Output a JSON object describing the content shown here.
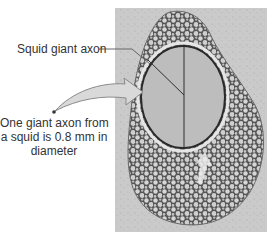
{
  "figure": {
    "label_axon": "Squid giant axon",
    "caption_lines": [
      "One giant axon from",
      "a squid is 0.8 mm in",
      "diameter"
    ],
    "colors": {
      "panel_background": "#c9c9c9",
      "tissue_dark": "#5a5a5a",
      "tissue_cell": "#d8d8d8",
      "axon_fill": "#bdbdbd",
      "axon_border": "#2a2a2a",
      "arrow_fill": "#d9d9d9",
      "arrow_stroke": "#8a8a8a",
      "leader_line": "#666666",
      "text": "#333333"
    }
  }
}
